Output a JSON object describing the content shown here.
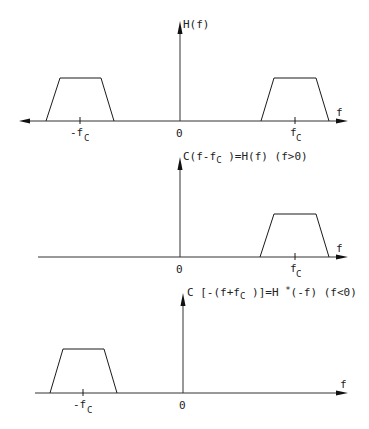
{
  "diagram": {
    "colors": {
      "line": "#1a1a1a",
      "text": "#222222",
      "background": "#ffffff"
    },
    "panels": [
      {
        "id": "top",
        "y_axis_label": "H(f)",
        "x_axis_label": "f",
        "origin_label": "0",
        "ticks": [
          {
            "label_main": "-f",
            "label_sub": "C",
            "position": "negative"
          },
          {
            "label_main": "f",
            "label_sub": "C",
            "position": "positive"
          }
        ],
        "shapes": [
          "trapezoid centered at -fc",
          "trapezoid centered at +fc"
        ],
        "x_axis_arrows": "both"
      },
      {
        "id": "middle",
        "y_axis_label_parts": {
          "pre": "C(f-",
          "sym": "f",
          "sym_sub": "C",
          "post": " )=H(f) (f>0)"
        },
        "y_axis_label": "C(f-fC )=H(f) (f>0)",
        "x_axis_label": "f",
        "origin_label": "0",
        "ticks": [
          {
            "label_main": "f",
            "label_sub": "C",
            "position": "positive"
          }
        ],
        "shapes": [
          "trapezoid centered at +fc"
        ],
        "x_axis_arrows": "right"
      },
      {
        "id": "bottom",
        "y_axis_label_parts": {
          "pre": "C [-(f+f",
          "sub": "C",
          "mid": " )]=H ",
          "sup": "*",
          "post": "(-f) (f<0)"
        },
        "y_axis_label": "C [-(f+fC )]=H *(-f) (f<0)",
        "x_axis_label": "f",
        "origin_label": "0",
        "ticks": [
          {
            "label_main": "-f",
            "label_sub": "C",
            "position": "negative"
          }
        ],
        "shapes": [
          "trapezoid centered at -fc"
        ],
        "x_axis_arrows": "right"
      }
    ]
  }
}
